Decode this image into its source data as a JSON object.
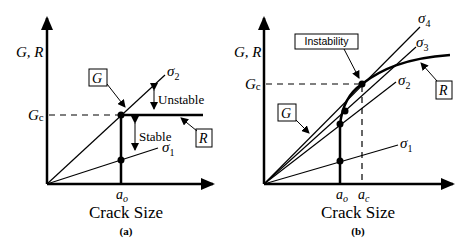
{
  "panels": [
    {
      "id": "a",
      "caption": "(a)",
      "x_label": "Crack Size",
      "y_label": "G, R",
      "gc_label": "G",
      "gc_sub": "c",
      "a0_label": "a",
      "a0_sub": "o",
      "g_box": "G",
      "r_box": "R",
      "unstable_label": "Unstable",
      "stable_label": "Stable",
      "curves": [
        {
          "name": "sigma1",
          "label": "σ",
          "sub": "1"
        },
        {
          "name": "sigma2",
          "label": "σ",
          "sub": "2"
        }
      ]
    },
    {
      "id": "b",
      "caption": "(b)",
      "x_label": "Crack Size",
      "y_label": "G, R",
      "gc_label": "G",
      "gc_sub": "c",
      "a0_label": "a",
      "a0_sub": "o",
      "ac_label": "a",
      "ac_sub": "c",
      "g_box": "G",
      "r_box": "R",
      "instability_label": "Instability",
      "curves": [
        {
          "name": "sigma1",
          "label": "σ",
          "sub": "1"
        },
        {
          "name": "sigma2",
          "label": "σ",
          "sub": "2"
        },
        {
          "name": "sigma3",
          "label": "σ",
          "sub": "3"
        },
        {
          "name": "sigma4",
          "label": "σ",
          "sub": "4"
        }
      ]
    }
  ]
}
